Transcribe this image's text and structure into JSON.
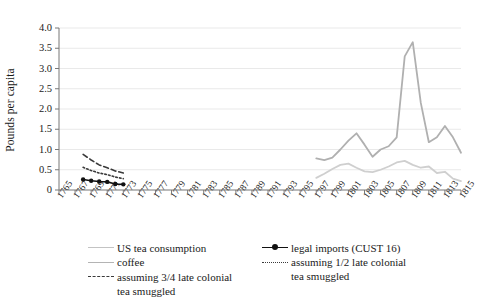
{
  "chart_data": {
    "type": "line",
    "title": "",
    "xlabel": "",
    "ylabel": "Pounds per capita",
    "ylim": [
      0,
      4.0
    ],
    "yticks": [
      "0",
      "0.5",
      "1.0",
      "1.5",
      "2.0",
      "2.5",
      "3.0",
      "3.5",
      "4.0"
    ],
    "xlim": [
      1765,
      1815
    ],
    "xticks": [
      "1765",
      "1767",
      "1769",
      "1771",
      "1773",
      "1775",
      "1777",
      "1779",
      "1781",
      "1783",
      "1785",
      "1787",
      "1789",
      "1791",
      "1793",
      "1795",
      "1797",
      "1799",
      "1801",
      "1803",
      "1805",
      "1807",
      "1809",
      "1811",
      "1813",
      "1815"
    ],
    "grid": "horizontal",
    "legend_position": "below",
    "series": [
      {
        "name": "US tea consumption",
        "color": "#b0b0b0",
        "style": "solid",
        "x": [
          1797,
          1798,
          1799,
          1800,
          1801,
          1802,
          1803,
          1804,
          1805,
          1806,
          1807,
          1808,
          1809,
          1810,
          1811,
          1812,
          1813,
          1814,
          1815
        ],
        "values": [
          0.78,
          0.74,
          0.8,
          1.0,
          1.22,
          1.4,
          1.12,
          0.82,
          1.0,
          1.08,
          1.3,
          3.3,
          3.65,
          2.15,
          1.18,
          1.3,
          1.58,
          1.3,
          0.92
        ]
      },
      {
        "name": "coffee",
        "color": "#cfcfcf",
        "style": "solid",
        "x": [
          1797,
          1798,
          1799,
          1800,
          1801,
          1802,
          1803,
          1804,
          1805,
          1806,
          1807,
          1808,
          1809,
          1810,
          1811,
          1812,
          1813,
          1814,
          1815
        ],
        "values": [
          0.3,
          0.4,
          0.52,
          0.62,
          0.65,
          0.55,
          0.46,
          0.44,
          0.5,
          0.58,
          0.68,
          0.72,
          0.62,
          0.55,
          0.58,
          0.42,
          0.45,
          0.28,
          0.22
        ]
      },
      {
        "name": "legal imports (CUST 16)",
        "color": "#111111",
        "style": "solid-marker",
        "x": [
          1768,
          1769,
          1770,
          1771,
          1772,
          1773
        ],
        "values": [
          0.26,
          0.23,
          0.21,
          0.2,
          0.15,
          0.14
        ]
      },
      {
        "name": "assuming 3/4 late colonial tea smuggled",
        "color": "#3a3a3a",
        "style": "dashed",
        "x": [
          1768,
          1769,
          1770,
          1771,
          1772,
          1773
        ],
        "values": [
          0.88,
          0.74,
          0.62,
          0.55,
          0.47,
          0.42
        ]
      },
      {
        "name": "assuming 1/2 late colonial tea smuggled",
        "color": "#3a3a3a",
        "style": "dotted",
        "x": [
          1768,
          1769,
          1770,
          1771,
          1772,
          1773
        ],
        "values": [
          0.56,
          0.48,
          0.42,
          0.38,
          0.32,
          0.28
        ]
      }
    ]
  },
  "axis": {
    "ylabel": "Pounds per capita"
  },
  "legend": {
    "items": [
      {
        "label": "US tea consumption",
        "marker": "line-solid-light"
      },
      {
        "label": "coffee",
        "marker": "line-solid-lighter"
      },
      {
        "label": "assuming 3/4 late colonial",
        "label2": "tea smuggled",
        "marker": "line-dashed"
      },
      {
        "label": "legal imports (CUST 16)",
        "marker": "line-black-marker"
      },
      {
        "label": "assuming 1/2 late colonial",
        "label2": "tea smuggled",
        "marker": "line-dotted"
      }
    ]
  }
}
